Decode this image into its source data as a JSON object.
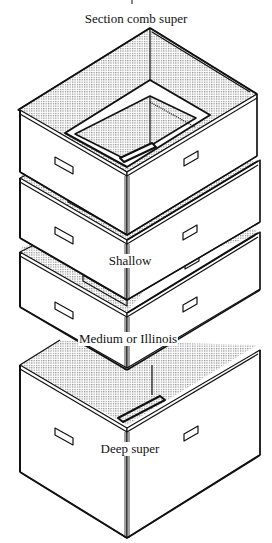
{
  "diagram": {
    "title_partial": "p",
    "labels": [
      {
        "id": "section-comb-super",
        "text": "Section comb super",
        "x": 136,
        "y": 12
      },
      {
        "id": "shallow",
        "text": "Shallow",
        "x": 130,
        "y": 254
      },
      {
        "id": "medium",
        "text": "Medium or Illinois",
        "x": 128,
        "y": 332
      },
      {
        "id": "deep",
        "text": "Deep super",
        "x": 130,
        "y": 442
      }
    ],
    "boxes": [
      "Section comb super",
      "Shallow",
      "Medium or Illinois",
      "Deep super"
    ],
    "colors": {
      "line": "#111111",
      "background": "#ffffff",
      "stipple": "#9a9a9a"
    }
  }
}
